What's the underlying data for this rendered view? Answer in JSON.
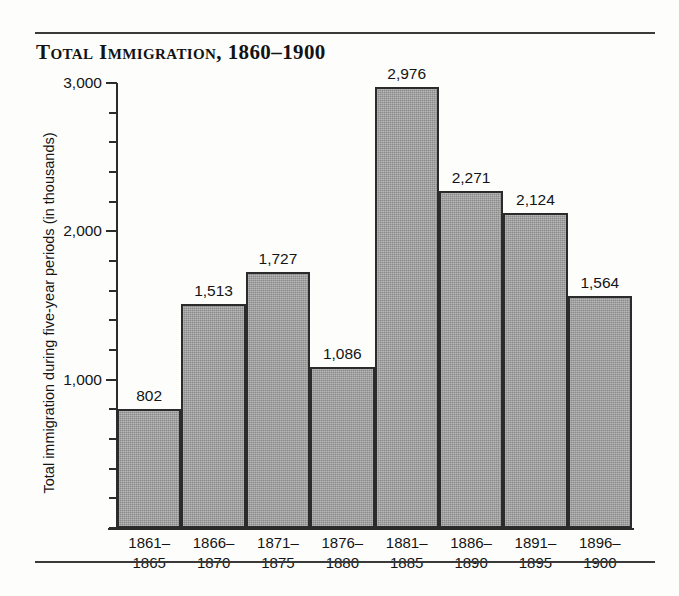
{
  "title": "Total Immigration, 1860–1900",
  "axes": {
    "y_title": "Total immigration during five-year periods  (in thousands)",
    "y_ticks_major": [
      "1,000",
      "2,000",
      "3,000"
    ]
  },
  "chart_data": {
    "type": "bar",
    "title": "Total Immigration, 1860–1900",
    "xlabel": "",
    "ylabel": "Total immigration during five-year periods  (in thousands)",
    "ylim": [
      0,
      3000
    ],
    "ytick_step_major": 1000,
    "ytick_step_minor": 200,
    "grid": false,
    "legend": null,
    "bar_gap": 0,
    "bar_fill_color": "#9a9a9a",
    "bar_edge_color": "#2b2b2b",
    "categories": [
      "1861–1865",
      "1866–1870",
      "1871–1875",
      "1876–1880",
      "1881–1885",
      "1886–1890",
      "1891–1895",
      "1896–1900"
    ],
    "category_lines": [
      [
        "1861–",
        "1865"
      ],
      [
        "1866–",
        "1870"
      ],
      [
        "1871–",
        "1875"
      ],
      [
        "1876–",
        "1880"
      ],
      [
        "1881–",
        "1885"
      ],
      [
        "1886–",
        "1890"
      ],
      [
        "1891–",
        "1895"
      ],
      [
        "1896–",
        "1900"
      ]
    ],
    "values": [
      802,
      1513,
      1727,
      1086,
      2976,
      2271,
      2124,
      1564
    ],
    "value_labels": [
      "802",
      "1,513",
      "1,727",
      "1,086",
      "2,976",
      "2,271",
      "2,124",
      "1,564"
    ]
  }
}
